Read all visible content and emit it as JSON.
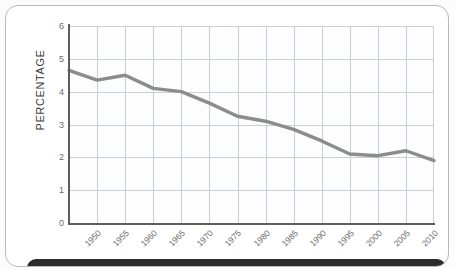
{
  "chart_data": {
    "type": "line",
    "title": "",
    "subtitle": "",
    "xlabel": "",
    "ylabel": "PERCENTAGE",
    "categories": [
      "1950",
      "1955",
      "1960",
      "1965",
      "1970",
      "1975",
      "1980",
      "1985",
      "1990",
      "1995",
      "2000",
      "2005",
      "2010",
      "2015"
    ],
    "x": [
      1950,
      1955,
      1960,
      1965,
      1970,
      1975,
      1980,
      1985,
      1990,
      1995,
      2000,
      2005,
      2010,
      2015
    ],
    "values": [
      4.65,
      4.35,
      4.5,
      4.1,
      4.0,
      3.65,
      3.25,
      3.1,
      2.85,
      2.5,
      2.1,
      2.05,
      2.2,
      1.9
    ],
    "series": [
      {
        "name": "Percentage",
        "values": [
          4.65,
          4.35,
          4.5,
          4.1,
          4.0,
          3.65,
          3.25,
          3.1,
          2.85,
          2.5,
          2.1,
          2.05,
          2.2,
          1.9
        ]
      }
    ],
    "ylim": [
      0,
      6
    ],
    "xlim": [
      1950,
      2015
    ],
    "yticks": [
      0,
      1,
      2,
      3,
      4,
      5,
      6
    ],
    "ytick_labels": [
      "0",
      "1",
      "2",
      "3",
      "4",
      "5",
      "6"
    ],
    "xtick_labels": [
      "1950",
      "1955",
      "1960",
      "1965",
      "1970",
      "1975",
      "1980",
      "1985",
      "1990",
      "1995",
      "2000",
      "2005",
      "2010",
      "2015"
    ],
    "grid": true,
    "legend": false,
    "legend_position": "none",
    "annotations": [],
    "line_color": "#8c8c8c",
    "grid_color": "#c9cfd6",
    "axis_color": "#5d5d5d",
    "tick_label_color": "#6b6b6b",
    "axis_title_color": "#3c3c3c",
    "plot_background": "#fdfdfd"
  },
  "card": {
    "background": "#ffffff",
    "border_color": "#b9b9b9"
  },
  "footer": {
    "background": "#2b2b2b",
    "label": ""
  }
}
